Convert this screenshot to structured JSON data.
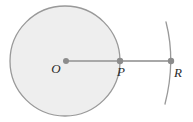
{
  "figure": {
    "background_color": "#ffffff",
    "stroke_color": "#999999",
    "fill_color": "#eeeeee",
    "line_color": "#a8a8a8",
    "dot_color": "#8c8c8c",
    "label_color": "#2b2b2b",
    "circle": {
      "name": "main-circle",
      "center_x": 65,
      "center_y": 61,
      "radius": 55,
      "fill": "#eeeeee",
      "stroke": "#999999",
      "stroke_width": 1.3
    },
    "arc": {
      "name": "right-arc",
      "path": "M 166 22 Q 176 61 165 104",
      "stroke": "#999999",
      "stroke_width": 1.3
    },
    "segments": [
      {
        "name": "segment-O-P",
        "x1": 66,
        "y1": 61,
        "x2": 120,
        "y2": 61,
        "stroke": "#a8a8a8",
        "stroke_width": 2.2
      },
      {
        "name": "segment-P-R",
        "x1": 120,
        "y1": 61,
        "x2": 171,
        "y2": 61,
        "stroke": "#a8a8a8",
        "stroke_width": 2.2
      }
    ],
    "points": [
      {
        "id": "O",
        "label": "O",
        "name": "point-O",
        "cx": 66,
        "cy": 61,
        "r": 3.0,
        "label_x": 56,
        "label_y": 73,
        "description": "center of circle"
      },
      {
        "id": "P",
        "label": "P",
        "name": "point-P",
        "cx": 120,
        "cy": 61,
        "r": 3.2,
        "label_x": 121,
        "label_y": 76,
        "description": "point on circle circumference"
      },
      {
        "id": "R",
        "label": "R",
        "name": "point-R",
        "cx": 171,
        "cy": 61,
        "r": 3.2,
        "label_x": 175,
        "label_y": 77,
        "description": "point on the arc to the right"
      }
    ]
  }
}
